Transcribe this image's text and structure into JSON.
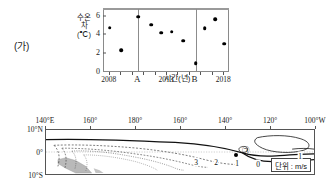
{
  "panel_ga": {
    "tag": "(가)",
    "y_axis_title_lines": [
      "수온",
      "차",
      "(℃)"
    ],
    "x_axis_title": "시간(년)",
    "y_ticks": [
      "0",
      "2",
      "4",
      "6"
    ],
    "x_labels": [
      "2008",
      "A",
      "2013",
      "B",
      "2018"
    ]
  },
  "panel_na": {
    "tag": "(나)",
    "lon_labels": [
      "140°E",
      "160°",
      "180°",
      "160°",
      "140°",
      "120°",
      "100°W"
    ],
    "lat_labels": [
      "10°N",
      "0°",
      "10°S"
    ],
    "contour_labels": [
      "3",
      "2",
      "1",
      "0",
      "1"
    ],
    "marker_label": "㉠",
    "unit_label": "단위 : m/s"
  },
  "chart_data": {
    "type": "scatter",
    "title": "",
    "xlabel": "시간(년)",
    "ylabel": "수온 차 (℃)",
    "xlim": [
      2007.5,
      2018.5
    ],
    "ylim": [
      0,
      6.8
    ],
    "grid": false,
    "legend": "none",
    "ytick_values": [
      0,
      2,
      4,
      6
    ],
    "xtick_labels": [
      "2008",
      "A",
      "2013",
      "B",
      "2018"
    ],
    "xtick_values": [
      2008,
      2010.5,
      2013,
      2015.5,
      2018
    ],
    "vertical_lines": [
      2010.5,
      2015.5
    ],
    "x": [
      2008,
      2009,
      2010.5,
      2011.6,
      2012.5,
      2013.4,
      2014.4,
      2015.5,
      2016.3,
      2017.2,
      2018
    ],
    "y": [
      4.8,
      2.4,
      6.0,
      5.15,
      4.3,
      4.4,
      3.45,
      1.05,
      4.75,
      5.7,
      3.1
    ],
    "points": [
      {
        "x": 2008,
        "y": 4.8
      },
      {
        "x": 2009,
        "y": 2.4
      },
      {
        "x": 2010.5,
        "y": 6.0
      },
      {
        "x": 2011.6,
        "y": 5.15
      },
      {
        "x": 2012.5,
        "y": 4.3
      },
      {
        "x": 2013.4,
        "y": 4.4
      },
      {
        "x": 2014.4,
        "y": 3.45
      },
      {
        "x": 2015.5,
        "y": 1.05
      },
      {
        "x": 2016.3,
        "y": 4.75
      },
      {
        "x": 2017.2,
        "y": 5.7
      },
      {
        "x": 2018,
        "y": 3.1
      }
    ]
  },
  "map_data": {
    "type": "contour",
    "xlabel": "",
    "ylabel": "",
    "unit": "m/s",
    "lon_range": [
      "140°E",
      "100°W"
    ],
    "lat_range": [
      "10°N",
      "10°S"
    ],
    "contour_values": [
      0,
      1,
      2,
      3
    ]
  }
}
